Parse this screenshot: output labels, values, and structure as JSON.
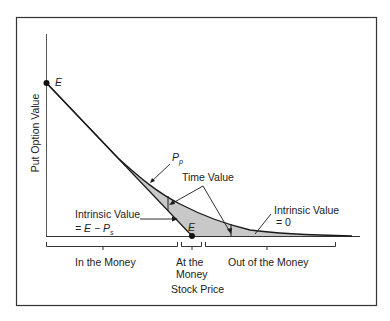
{
  "diagram": {
    "type": "put_option_value_diagram",
    "colors": {
      "frame": "#333333",
      "line": "#1a1a1a",
      "time_value_fill": "#c8c8c8",
      "text": "#222222"
    },
    "axes": {
      "y_label": "Put Option Value",
      "x_label": "Stock Price"
    },
    "points": {
      "y_intercept_label": "E",
      "x_intercept_label": "E"
    },
    "curve_label": "P",
    "curve_label_sub": "p",
    "annotations": {
      "time_value": "Time Value",
      "intrinsic_left_line1": "Intrinsic Value",
      "intrinsic_left_line2_prefix": "= E − P",
      "intrinsic_left_line2_sub": "s",
      "intrinsic_right_line1": "Intrinsic Value",
      "intrinsic_right_line2": "= 0"
    },
    "regions": [
      {
        "label_line1": "In the Money",
        "label_line2": ""
      },
      {
        "label_line1": "At the",
        "label_line2": "Money"
      },
      {
        "label_line1": "Out of the Money",
        "label_line2": ""
      }
    ]
  }
}
